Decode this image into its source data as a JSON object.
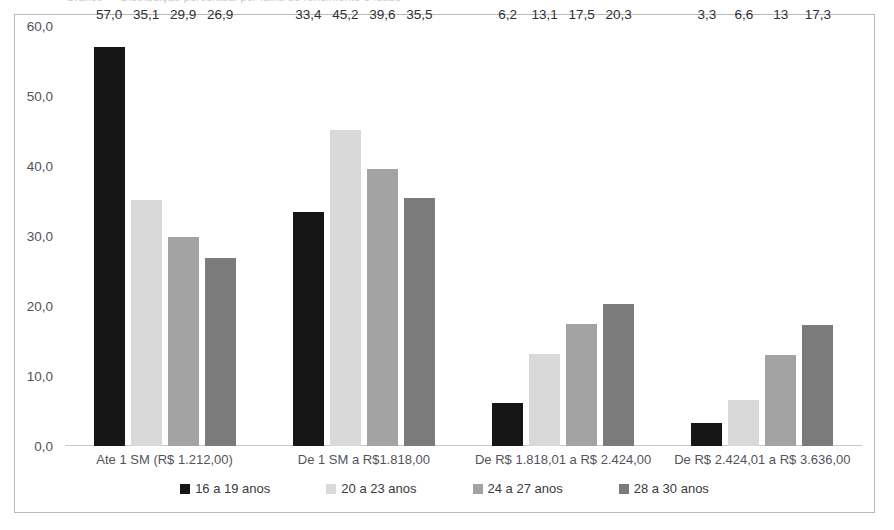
{
  "caption": {
    "text": "Gráfico — Distribuição percentual por faixa de rendimento e idade"
  },
  "chart_data": {
    "type": "bar",
    "title": "",
    "xlabel": "",
    "ylabel": "",
    "ylim": [
      0,
      60
    ],
    "ytick_labels": [
      "60,0",
      "50,0",
      "40,0",
      "30,0",
      "20,0",
      "10,0",
      "0,0"
    ],
    "ytick_values": [
      60,
      50,
      40,
      30,
      20,
      10,
      0
    ],
    "grid": false,
    "legend_position": "bottom",
    "categories": [
      "Ate 1 SM (R$ 1.212,00)",
      "De 1 SM a R$1.818,00",
      "De R$ 1.818,01 a R$ 2.424,00",
      "De R$ 2.424,01 a R$ 3.636,00"
    ],
    "series": [
      {
        "name": "16 a 19 anos",
        "color": "#161616",
        "values": [
          57.0,
          33.4,
          6.2,
          3.3
        ],
        "labels": [
          "57,0",
          "33,4",
          "6,2",
          "3,3"
        ]
      },
      {
        "name": "20 a 23 anos",
        "color": "#d9d9d9",
        "values": [
          35.1,
          45.2,
          13.1,
          6.6
        ],
        "labels": [
          "35,1",
          "45,2",
          "13,1",
          "6,6"
        ]
      },
      {
        "name": "24 a 27 anos",
        "color": "#a3a3a3",
        "values": [
          29.9,
          39.6,
          17.5,
          13.0
        ],
        "labels": [
          "29,9",
          "39,6",
          "17,5",
          "13"
        ]
      },
      {
        "name": "28 a 30 anos",
        "color": "#7b7b7b",
        "values": [
          26.9,
          35.5,
          20.3,
          17.3
        ],
        "labels": [
          "26,9",
          "35,5",
          "20,3",
          "17,3"
        ]
      }
    ]
  }
}
